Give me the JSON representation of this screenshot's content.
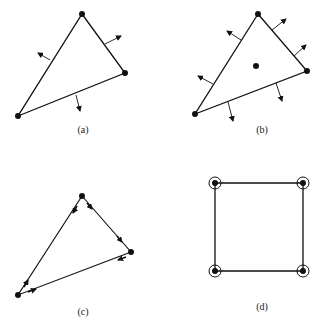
{
  "figure": {
    "panels": [
      {
        "id": "a",
        "label": "(a)",
        "label_pos": [
          83,
          133
        ],
        "shape": "triangle",
        "vertices": [
          [
            82,
            14
          ],
          [
            125,
            73
          ],
          [
            18,
            116
          ]
        ],
        "description": "Triangle with outward edge normals at edge midpoints",
        "normals": [
          {
            "from": [
              50,
              60
            ],
            "to": [
              38,
              53
            ]
          },
          {
            "from": [
              105,
              44
            ],
            "to": [
              121,
              36
            ]
          },
          {
            "from": [
              76,
              95
            ],
            "to": [
              80,
              111
            ]
          }
        ],
        "center_dot": null
      },
      {
        "id": "b",
        "label": "(b)",
        "label_pos": [
          262,
          133
        ],
        "shape": "triangle",
        "vertices": [
          [
            258,
            14
          ],
          [
            307,
            71
          ],
          [
            195,
            114
          ]
        ],
        "description": "Triangle with two outward normals per edge and a center point",
        "normals": [
          {
            "from": [
              241,
              40
            ],
            "to": [
              227,
              31
            ]
          },
          {
            "from": [
              213,
              84
            ],
            "to": [
              198,
              76
            ]
          },
          {
            "from": [
              272,
              30
            ],
            "to": [
              286,
              19
            ]
          },
          {
            "from": [
              294,
              56
            ],
            "to": [
              306,
              45
            ]
          },
          {
            "from": [
              228,
              102
            ],
            "to": [
              233,
              121
            ]
          },
          {
            "from": [
              276,
              83
            ],
            "to": [
              282,
              101
            ]
          }
        ],
        "center_dot": [
          256,
          66
        ]
      },
      {
        "id": "c",
        "label": "(c)",
        "label_pos": [
          83,
          315
        ],
        "shape": "triangle",
        "vertices": [
          [
            82,
            196
          ],
          [
            131,
            252
          ],
          [
            18,
            295
          ]
        ],
        "description": "Triangle drawn as directed half-edges with arrows along each side",
        "edge_arrows": [
          {
            "from": [
              77,
              206
            ],
            "to": [
              73,
              213
            ]
          },
          {
            "from": [
              87,
              203
            ],
            "to": [
              92,
              209
            ]
          },
          {
            "from": [
              117,
              236
            ],
            "to": [
              122,
              242
            ]
          },
          {
            "from": [
              126,
              257
            ],
            "to": [
              118,
              260
            ]
          },
          {
            "from": [
              28,
              292
            ],
            "to": [
              36,
              289
            ]
          },
          {
            "from": [
              24,
              287
            ],
            "to": [
              28,
              280
            ]
          }
        ]
      },
      {
        "id": "d",
        "label": "(d)",
        "label_pos": [
          262,
          310
        ],
        "shape": "square",
        "vertices": [
          [
            215,
            183
          ],
          [
            303,
            183
          ],
          [
            303,
            271
          ],
          [
            215,
            271
          ]
        ],
        "description": "Square with circled vertex points",
        "circled_vertices": true
      }
    ]
  }
}
